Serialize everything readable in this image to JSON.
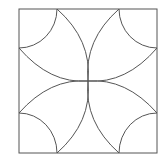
{
  "diagram": {
    "type": "geometric-figure",
    "stroke_color": "#555555",
    "background": "#ffffff"
  }
}
